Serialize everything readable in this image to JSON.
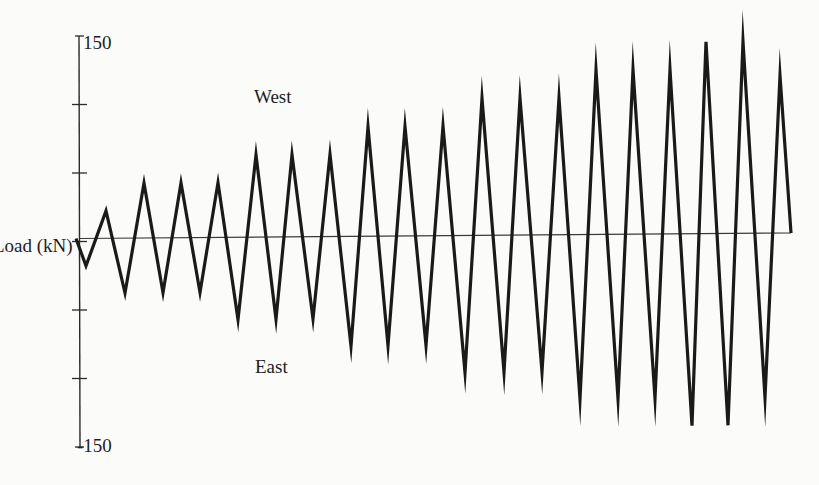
{
  "chart_data": {
    "type": "line",
    "title": "",
    "xlabel": "",
    "ylabel": "Load (kN)",
    "ylim": [
      -150,
      150
    ],
    "yticks": [
      150,
      100,
      50,
      0,
      -50,
      -100,
      -150
    ],
    "ytick_labels_shown": [
      "150",
      "-150"
    ],
    "grid": false,
    "legend": null,
    "annotations": [
      {
        "text": "West",
        "position": "upper (positive load)"
      },
      {
        "text": "East",
        "position": "lower (negative load)"
      }
    ],
    "series": [
      {
        "name": "Cyclic load history",
        "x_px": [
          76,
          86,
          106,
          125,
          144,
          163,
          181,
          200,
          218,
          238,
          256,
          276,
          292,
          313,
          330,
          351,
          368,
          388,
          405,
          426,
          443,
          465,
          482,
          504,
          520,
          542,
          559,
          580,
          596,
          618,
          633,
          655,
          670,
          692,
          706,
          728,
          743,
          765,
          780,
          791
        ],
        "values": [
          0,
          -20,
          20,
          -40,
          40,
          -40,
          40,
          -40,
          40,
          -60,
          60,
          -60,
          60,
          -60,
          60,
          -80,
          80,
          -80,
          80,
          -80,
          80,
          -100,
          100,
          -100,
          100,
          -100,
          100,
          -120,
          120,
          -120,
          120,
          -120,
          120,
          -140,
          140,
          -140,
          140,
          -120,
          115,
          0
        ]
      }
    ]
  },
  "axis": {
    "top_label": "150",
    "bottom_label": "-150",
    "ylabel": "Load (kN)"
  },
  "annotations": {
    "west": "West",
    "east": "East"
  }
}
